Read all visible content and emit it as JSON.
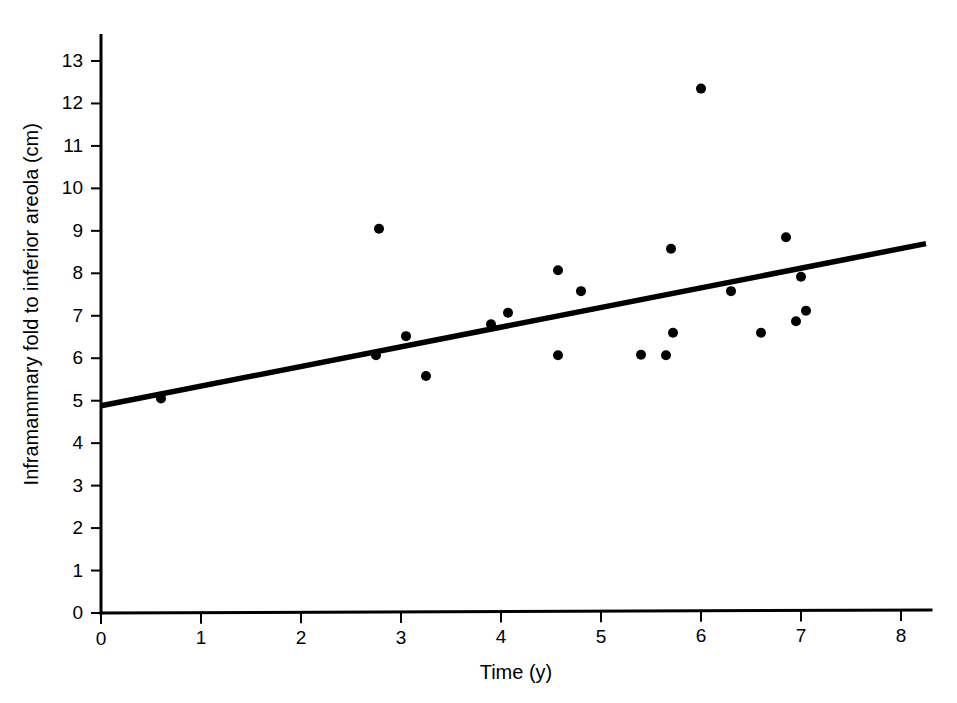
{
  "chart_data": {
    "type": "scatter",
    "title": "",
    "xlabel": "Time (y)",
    "ylabel": "Inframammary fold to inferior areola (cm)",
    "xlim": [
      0,
      8.3
    ],
    "ylim": [
      0,
      13.6
    ],
    "xticks": [
      "0",
      "1",
      "2",
      "3",
      "4",
      "5",
      "6",
      "7",
      "8"
    ],
    "xtick_values": [
      0,
      1,
      2,
      3,
      4,
      5,
      6,
      7,
      8
    ],
    "yticks": [
      "0",
      "1",
      "2",
      "3",
      "4",
      "5",
      "6",
      "7",
      "8",
      "9",
      "10",
      "11",
      "12",
      "13"
    ],
    "ytick_values": [
      0,
      1,
      2,
      3,
      4,
      5,
      6,
      7,
      8,
      9,
      10,
      11,
      12,
      13
    ],
    "grid": false,
    "legend": null,
    "marker_color": "#000000",
    "line_color": "#000000",
    "axis_color": "#000000",
    "background_color": "#ffffff",
    "points": [
      {
        "x": 0.6,
        "y": 5.05
      },
      {
        "x": 2.75,
        "y": 6.07
      },
      {
        "x": 2.78,
        "y": 9.05
      },
      {
        "x": 3.05,
        "y": 6.52
      },
      {
        "x": 3.25,
        "y": 5.58
      },
      {
        "x": 3.9,
        "y": 6.8
      },
      {
        "x": 4.07,
        "y": 7.07
      },
      {
        "x": 4.57,
        "y": 8.07
      },
      {
        "x": 4.57,
        "y": 6.07
      },
      {
        "x": 4.8,
        "y": 7.58
      },
      {
        "x": 5.4,
        "y": 6.08
      },
      {
        "x": 5.65,
        "y": 6.07
      },
      {
        "x": 5.7,
        "y": 8.58
      },
      {
        "x": 5.72,
        "y": 6.6
      },
      {
        "x": 6.0,
        "y": 12.35
      },
      {
        "x": 6.3,
        "y": 7.58
      },
      {
        "x": 6.6,
        "y": 6.6
      },
      {
        "x": 6.85,
        "y": 8.85
      },
      {
        "x": 6.95,
        "y": 6.87
      },
      {
        "x": 7.0,
        "y": 7.92
      },
      {
        "x": 7.05,
        "y": 7.12
      }
    ],
    "regression_line": {
      "x_start": 0,
      "y_start": 4.88,
      "x_end": 8.25,
      "y_end": 8.7
    }
  }
}
